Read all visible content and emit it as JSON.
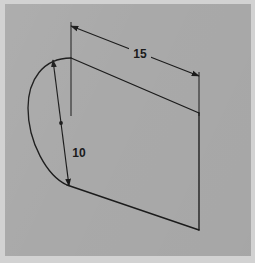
{
  "drawing": {
    "title": "Extruded half-disc solid with dimensions",
    "background_color": "#a9a9a9",
    "frame_color": "#d2d2d2",
    "line_color": "#1b1b1b",
    "canvas": {
      "width": 246,
      "height": 252
    },
    "geometry": {
      "shape_name": "half-cylinder-extrusion",
      "arc_name": "semicircular-arc-face",
      "top_edge_name": "top-edge",
      "bottom_edge_name": "bottom-edge",
      "right_edge_name": "right-vertical-edge",
      "center_point_name": "arc-center-point"
    },
    "dimensions": [
      {
        "id": "length",
        "label": "15",
        "label_x": 135,
        "label_y": 55,
        "description": "overall length along top edge",
        "arrow_start": {
          "x": 71,
          "y": 26
        },
        "arrow_end": {
          "x": 199,
          "y": 76
        }
      },
      {
        "id": "radius",
        "label": "10",
        "label_x": 80,
        "label_y": 154,
        "description": "radius of circular arc",
        "arrow_start": {
          "x": 52,
          "y": 60
        },
        "arrow_end": {
          "x": 67,
          "y": 185
        }
      }
    ]
  }
}
